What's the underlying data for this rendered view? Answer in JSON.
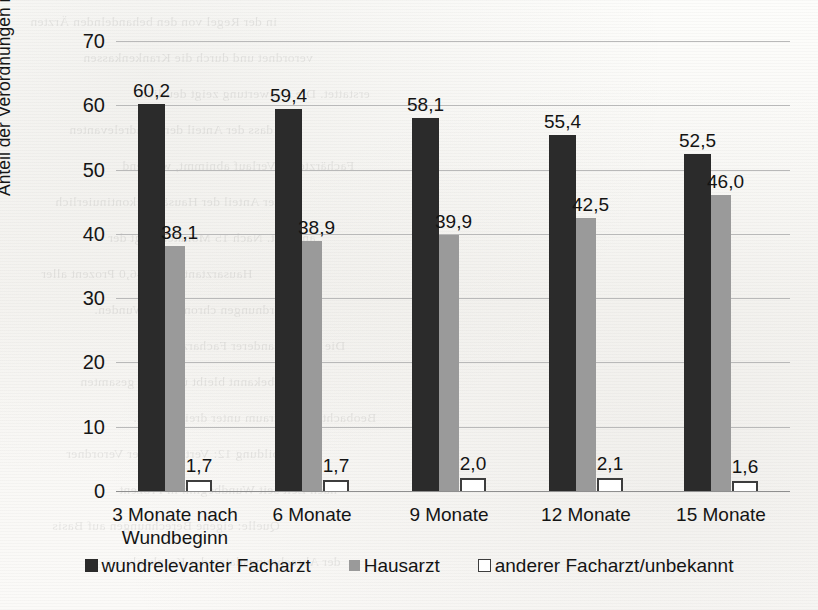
{
  "chart_data": {
    "type": "bar",
    "title": "",
    "xlabel": "",
    "ylabel": "Anteil der Verordnungen in %",
    "ylim": [
      0,
      70
    ],
    "ytick_step": 10,
    "yticks": [
      "70",
      "60",
      "50",
      "40",
      "30",
      "20",
      "10",
      "0"
    ],
    "grid": true,
    "legend_position": "bottom",
    "categories": [
      "3 Monate nach Wundbeginn",
      "6 Monate",
      "9 Monate",
      "12 Monate",
      "15 Monate"
    ],
    "series": [
      {
        "name": "wundrelevanter Facharzt",
        "color": "#2b2b2b",
        "style": "filled-dark",
        "values": [
          60.2,
          59.4,
          58.1,
          55.4,
          52.5
        ],
        "labels": [
          "60,2",
          "59,4",
          "58,1",
          "55,4",
          "52,5"
        ]
      },
      {
        "name": "Hausarzt",
        "color": "#9a9a9a",
        "style": "filled-gray",
        "values": [
          38.1,
          38.9,
          39.9,
          42.5,
          46.0
        ],
        "labels": [
          "38,1",
          "38,9",
          "39,9",
          "42,5",
          "46,0"
        ]
      },
      {
        "name": "anderer Facharzt/unbekannt",
        "color": "#ffffff",
        "style": "outlined",
        "values": [
          1.7,
          1.7,
          2.0,
          2.1,
          1.6
        ],
        "labels": [
          "1,7",
          "1,7",
          "2,0",
          "2,1",
          "1,6"
        ]
      }
    ]
  },
  "axis": {
    "y_title": "Anteil der Verordnungen in %",
    "ticks": [
      "70",
      "60",
      "50",
      "40",
      "30",
      "20",
      "10",
      "0"
    ]
  },
  "categories": [
    {
      "line1": "3 Monate nach",
      "line2": "Wundbeginn"
    },
    {
      "line1": "6 Monate",
      "line2": ""
    },
    {
      "line1": "9 Monate",
      "line2": ""
    },
    {
      "line1": "12 Monate",
      "line2": ""
    },
    {
      "line1": "15 Monate",
      "line2": ""
    }
  ],
  "legend": {
    "items": [
      {
        "label": "wundrelevanter Facharzt",
        "marker": "dark-square-icon"
      },
      {
        "label": "Hausarzt",
        "marker": "gray-square-icon"
      },
      {
        "label": "anderer Facharzt/unbekannt",
        "marker": "outlined-square-icon"
      }
    ]
  },
  "ghost_text": {
    "lines": [
      "in der Regel von den behandelnden Ärzten",
      "verordnet und durch die Krankenkassen",
      "erstattet. Die Auswertung zeigt deutlich,",
      "dass der Anteil der wundrelevanten",
      "Fachärzte im Verlauf abnimmt, während",
      "der Anteil der Hausärzte kontinuierlich",
      "ansteigt. Nach 15 Monaten liegt der",
      "Hausarztanteil bei 46,0 Prozent aller",
      "Verordnungen chronischer Wunden.",
      "Die Gruppe anderer Facharzt bzw.",
      "unbekannt bleibt über den gesamten",
      "Beobachtungszeitraum unter drei Prozent.",
      "Abbildung 12: Verteilung der Verordner",
      "nach Zeit seit Wundbeginn in Prozent",
      "Quelle: eigene Berechnungen auf Basis",
      "der Abrechnungsdaten der Krankenkasse"
    ]
  }
}
